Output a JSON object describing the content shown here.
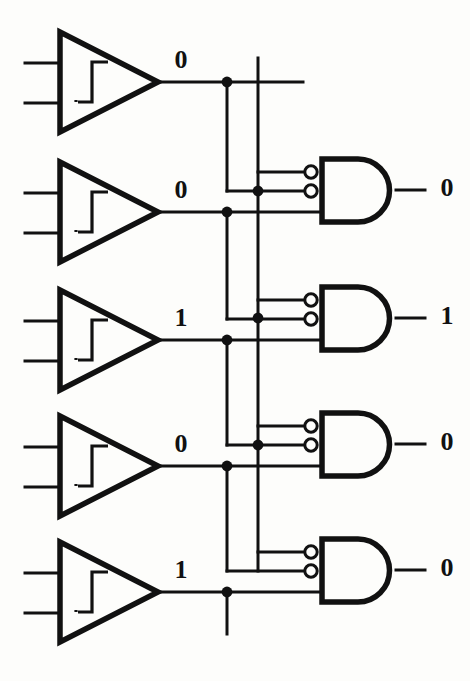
{
  "diagram": {
    "type": "logic-circuit-schematic",
    "background_color": "#fdfdfb",
    "ink_color": "#111111"
  },
  "buffers": [
    {
      "id": "buffer-1",
      "symbol": "schmitt-trigger-buffer",
      "output_value": "0",
      "input_count": 2
    },
    {
      "id": "buffer-2",
      "symbol": "schmitt-trigger-buffer",
      "output_value": "0",
      "input_count": 2
    },
    {
      "id": "buffer-3",
      "symbol": "schmitt-trigger-buffer",
      "output_value": "1",
      "input_count": 2
    },
    {
      "id": "buffer-4",
      "symbol": "schmitt-trigger-buffer",
      "output_value": "0",
      "input_count": 2
    },
    {
      "id": "buffer-5",
      "symbol": "schmitt-trigger-buffer",
      "output_value": "1",
      "input_count": 2
    }
  ],
  "gates": [
    {
      "id": "gate-1",
      "symbol": "and-gate",
      "inverted_inputs": 2,
      "direct_inputs": 1,
      "output_value": "0"
    },
    {
      "id": "gate-2",
      "symbol": "and-gate",
      "inverted_inputs": 2,
      "direct_inputs": 1,
      "output_value": "1"
    },
    {
      "id": "gate-3",
      "symbol": "and-gate",
      "inverted_inputs": 2,
      "direct_inputs": 1,
      "output_value": "0"
    },
    {
      "id": "gate-4",
      "symbol": "and-gate",
      "inverted_inputs": 2,
      "direct_inputs": 1,
      "output_value": "0"
    }
  ],
  "bus": {
    "vertical_line_count": 2,
    "junction_dot_count": 9
  }
}
